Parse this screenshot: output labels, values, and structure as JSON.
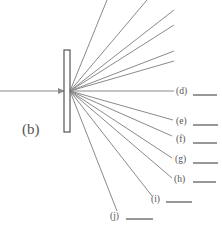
{
  "figure": {
    "panel_label": "(b)",
    "colors": {
      "rays": "#8a8a8a",
      "text": "#555555",
      "blanks": "#444444",
      "background": "#ffffff"
    },
    "source": {
      "x": 70,
      "y": 91
    },
    "incident_beam": {
      "x1": 0,
      "y1": 91,
      "x2": 64,
      "y2": 91
    },
    "grating": {
      "x": 64,
      "y": 50,
      "width": 6,
      "height": 82
    },
    "unlabeled_rays": [
      {
        "x2": 107,
        "y2": 0
      },
      {
        "x2": 147,
        "y2": 0
      },
      {
        "x2": 174,
        "y2": 10
      },
      {
        "x2": 174,
        "y2": 25
      },
      {
        "x2": 174,
        "y2": 51
      },
      {
        "x2": 174,
        "y2": 61
      }
    ],
    "labeled_rays": [
      {
        "label": "(d)",
        "x2": 174,
        "y2": 91,
        "label_x": 176,
        "label_y": 94,
        "blank_x1": 193,
        "blank_x2": 217,
        "blank_y": 95
      },
      {
        "label": "(e)",
        "x2": 173,
        "y2": 120,
        "label_x": 176,
        "label_y": 124,
        "blank_x1": 193,
        "blank_x2": 218,
        "blank_y": 125
      },
      {
        "label": "(f)",
        "x2": 172,
        "y2": 136,
        "label_x": 176,
        "label_y": 142,
        "blank_x1": 193,
        "blank_x2": 217,
        "blank_y": 143
      },
      {
        "label": "(g)",
        "x2": 172,
        "y2": 158,
        "label_x": 175,
        "label_y": 162,
        "blank_x1": 193,
        "blank_x2": 218,
        "blank_y": 163
      },
      {
        "label": "(h)",
        "x2": 172,
        "y2": 178,
        "label_x": 174,
        "label_y": 182,
        "blank_x1": 193,
        "blank_x2": 216,
        "blank_y": 182
      },
      {
        "label": "(i)",
        "x2": 152,
        "y2": 196,
        "label_x": 151,
        "label_y": 202,
        "blank_x1": 166,
        "blank_x2": 192,
        "blank_y": 202
      },
      {
        "label": "(j)",
        "x2": 117,
        "y2": 211,
        "label_x": 110,
        "label_y": 219,
        "blank_x1": 126,
        "blank_x2": 153,
        "blank_y": 219
      }
    ]
  }
}
